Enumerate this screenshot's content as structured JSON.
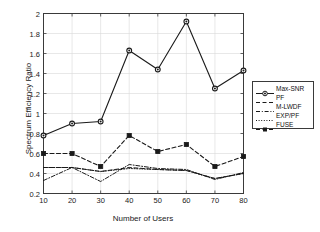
{
  "chart_data": {
    "type": "line",
    "title": "",
    "xlabel": "Number of Users",
    "ylabel": "Spectrum Efficiency Ratio",
    "x": [
      10,
      20,
      30,
      40,
      50,
      60,
      70,
      80
    ],
    "xticks": [
      "10",
      "20",
      "30",
      "40",
      "50",
      "60",
      "70",
      "80"
    ],
    "yticks": [
      "0.2",
      "0.4",
      "0.6",
      "0.8",
      "1",
      "1.2",
      "1.4",
      "1.6",
      "1.8",
      "2"
    ],
    "xlim": [
      10,
      80
    ],
    "ylim": [
      0.2,
      2
    ],
    "grid": true,
    "legend_position": "right-outside",
    "series": [
      {
        "name": "Max-SNR",
        "style": "solid",
        "marker": "circle",
        "color": "#1a1a1a",
        "values": [
          0.78,
          0.9,
          0.92,
          1.63,
          1.44,
          1.92,
          1.25,
          1.43
        ]
      },
      {
        "name": "PF",
        "style": "dashed",
        "marker": "none",
        "color": "#1a1a1a",
        "values": [
          0.46,
          0.46,
          0.42,
          0.46,
          0.44,
          0.43,
          0.35,
          0.4
        ]
      },
      {
        "name": "M-LWDF",
        "style": "dashdot",
        "marker": "none",
        "color": "#1a1a1a",
        "values": [
          0.33,
          0.46,
          0.32,
          0.49,
          0.45,
          0.44,
          0.34,
          0.41
        ]
      },
      {
        "name": "EXP/PF",
        "style": "dotted",
        "marker": "none",
        "color": "#1a1a1a",
        "values": [
          0.46,
          0.46,
          0.42,
          0.45,
          0.44,
          0.43,
          0.35,
          0.4
        ]
      },
      {
        "name": "FUSE",
        "style": "dashed",
        "marker": "square",
        "color": "#1a1a1a",
        "values": [
          0.6,
          0.6,
          0.47,
          0.78,
          0.62,
          0.69,
          0.47,
          0.57
        ]
      }
    ]
  },
  "colors": {
    "axis": "#3a3a3a",
    "grid": "#d9d9d9",
    "line": "#1a1a1a",
    "background": "#ffffff"
  }
}
